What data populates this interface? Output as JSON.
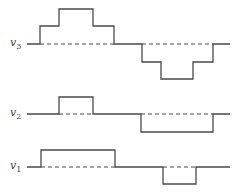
{
  "diagram": {
    "type": "stepped-waveforms",
    "stroke_color": "#4a4a4a",
    "dash_color": "#4a4a4a",
    "background": "#ffffff",
    "signals": [
      {
        "name": "v3",
        "label_base": "v",
        "label_sub": "3",
        "baseline_y": 44,
        "path": "M27,44 L40,44 L40,26 L59,26 L59,9 L93,9 L93,26 L114,26 L114,44 L142,44 L142,62 L161,62 L161,79 L193,79 L193,62 L213,62 L213,44 L230,44",
        "dashes": [
          [
            40,
            114
          ],
          [
            142,
            213
          ]
        ]
      },
      {
        "name": "v2",
        "label_base": "v",
        "label_sub": "2",
        "baseline_y": 114,
        "path": "M27,114 L59,114 L59,97 L93,97 L93,114 L141,114 L141,132 L213,132 L213,114 L230,114",
        "dashes": [
          [
            59,
            93
          ],
          [
            141,
            213
          ]
        ]
      },
      {
        "name": "v1",
        "label_base": "v",
        "label_sub": "1",
        "baseline_y": 167,
        "path": "M27,167 L41,167 L41,150 L115,150 L115,167 L163,167 L163,184 L196,184 L196,167 L230,167",
        "dashes": [
          [
            41,
            115
          ],
          [
            163,
            196
          ]
        ]
      }
    ]
  }
}
